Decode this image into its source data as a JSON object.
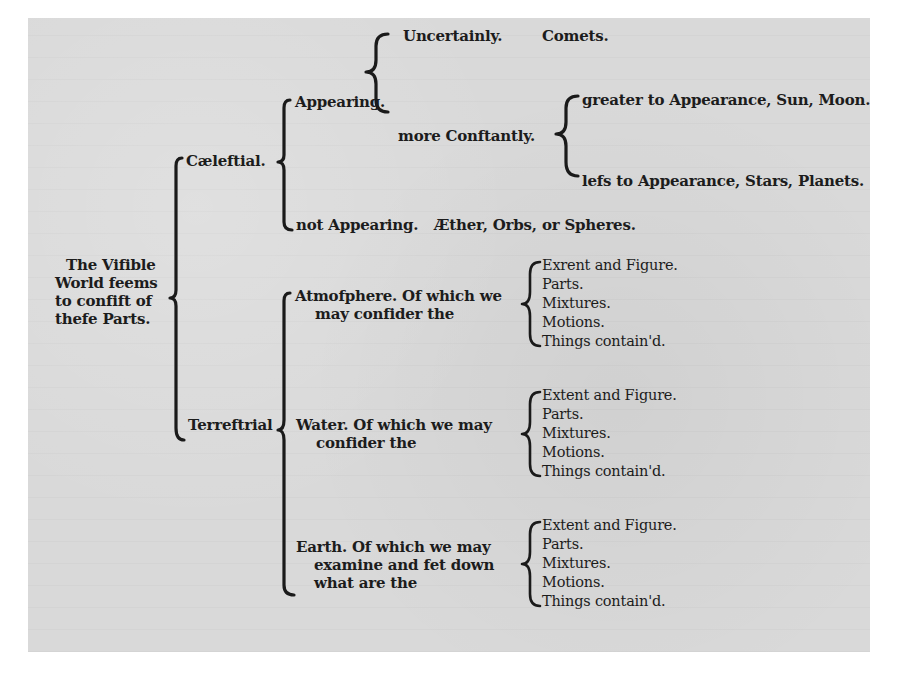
{
  "root": {
    "label_lines": [
      "The Vifible",
      "World feems",
      "to confift of",
      "thefe Parts."
    ]
  },
  "celestial": {
    "label": "Cæleftial.",
    "appearing": {
      "label": "Appearing.",
      "uncertainly": {
        "label": "Uncertainly.",
        "value": "Comets."
      },
      "more_constantly": {
        "label": "more Conftantly.",
        "greater": "greater to Appearance, Sun, Moon.",
        "less": "lefs to Appearance, Stars, Planets."
      }
    },
    "not_appearing": {
      "label": "not Appearing.",
      "value": "Æther, Orbs, or Spheres."
    }
  },
  "terrestrial": {
    "label": "Terreftrial",
    "atmosphere": {
      "label_lines": [
        "Atmofphere.  Of which we",
        "may confider the"
      ],
      "items": [
        "Exrent and Figure.",
        "Parts.",
        "Mixtures.",
        "Motions.",
        "Things contain'd."
      ]
    },
    "water": {
      "label_lines": [
        "Water.   Of which we may",
        "confider the"
      ],
      "items": [
        "Extent and Figure.",
        "Parts.",
        "Mixtures.",
        "Motions.",
        "Things contain'd."
      ]
    },
    "earth": {
      "label_lines": [
        "Earth.  Of which we may",
        "examine  and  fet down",
        "what are the"
      ],
      "items": [
        "Extent and Figure.",
        "Parts.",
        "Mixtures.",
        "Motions.",
        "Things contain'd."
      ]
    }
  }
}
